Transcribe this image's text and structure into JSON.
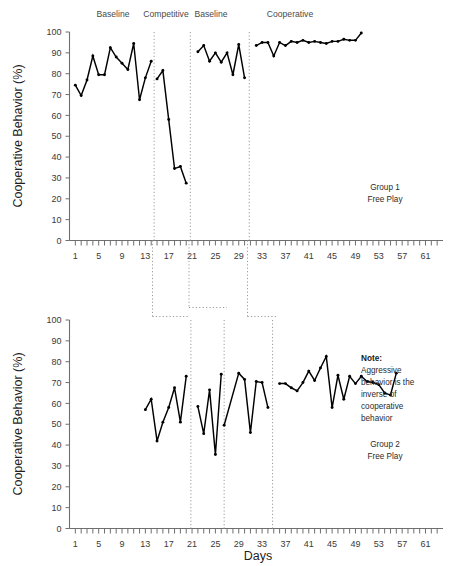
{
  "figure": {
    "xlabel": "Days",
    "ylabel_top": "Cooperative Behavior (%)",
    "ylabel_bottom": "Cooperative Behavior (%)"
  },
  "chart_data": [
    {
      "type": "line",
      "title": "Group 1 Free Play",
      "panel": "top",
      "xlabel": "",
      "ylabel": "Cooperative Behavior (%)",
      "xlim": [
        0,
        64
      ],
      "ylim": [
        0,
        100
      ],
      "grid": false,
      "legend": "none",
      "xticks": [
        1,
        5,
        9,
        13,
        17,
        21,
        25,
        29,
        33,
        37,
        41,
        45,
        49,
        53,
        57,
        61
      ],
      "yticks": [
        0,
        10,
        20,
        30,
        40,
        50,
        60,
        70,
        80,
        90,
        100
      ],
      "annotations": [
        "Group 1",
        "Free Play"
      ],
      "phases": [
        {
          "label": "Baseline",
          "x_start": 1,
          "x_end": 14
        },
        {
          "label": "Competitive",
          "x_start": 15,
          "x_end": 20
        },
        {
          "label": "Baseline",
          "x_start": 22,
          "x_end": 30
        },
        {
          "label": "Cooperative",
          "x_start": 32,
          "x_end": 50
        }
      ],
      "phase_dividers": [
        14.5,
        20.7,
        30.8
      ],
      "series": [
        {
          "name": "Baseline 1",
          "x": [
            1,
            2,
            3,
            4,
            5,
            6,
            7,
            8,
            9,
            10,
            11,
            12,
            13,
            14
          ],
          "values": [
            74.5,
            69.5,
            77.0,
            88.5,
            79.5,
            79.5,
            92.5,
            88.0,
            85.0,
            82.0,
            94.5,
            67.5,
            78.0,
            86.0
          ]
        },
        {
          "name": "Competitive",
          "x": [
            15,
            16,
            17,
            18,
            19,
            20
          ],
          "values": [
            77.5,
            81.5,
            58.0,
            34.5,
            35.5,
            27.5
          ]
        },
        {
          "name": "Baseline 2",
          "x": [
            22,
            23,
            24,
            25,
            26,
            27,
            28,
            29,
            30
          ],
          "values": [
            90.5,
            93.5,
            86.0,
            90.0,
            85.5,
            90.0,
            79.5,
            94.0,
            78.0
          ]
        },
        {
          "name": "Cooperative",
          "x": [
            32,
            33,
            34,
            35,
            36,
            37,
            38,
            39,
            40,
            41,
            42,
            43,
            44,
            45,
            46,
            47,
            48,
            49,
            50
          ],
          "values": [
            93.5,
            95.0,
            95.0,
            88.5,
            95.0,
            93.5,
            95.5,
            95.0,
            96.0,
            95.0,
            95.5,
            95.0,
            94.5,
            95.5,
            95.5,
            96.5,
            96.0,
            96.0,
            99.5
          ]
        }
      ]
    },
    {
      "type": "line",
      "title": "Group 2 Free Play",
      "panel": "bottom",
      "xlabel": "Days",
      "ylabel": "Cooperative Behavior (%)",
      "xlim": [
        0,
        64
      ],
      "ylim": [
        0,
        100
      ],
      "grid": false,
      "legend": "none",
      "xticks": [
        1,
        5,
        9,
        13,
        17,
        21,
        25,
        29,
        33,
        37,
        41,
        45,
        49,
        53,
        57,
        61
      ],
      "yticks": [
        0,
        10,
        20,
        30,
        40,
        50,
        60,
        70,
        80,
        90,
        100
      ],
      "annotations": [
        "Note:",
        "Aggressive",
        "behavior is the",
        "inverse of",
        "cooperative",
        "behavior",
        "Group 2",
        "Free Play"
      ],
      "phase_dividers": [
        20.8,
        26.5,
        34.8
      ],
      "series": [
        {
          "name": "Baseline 1",
          "x": [
            13,
            14,
            15,
            16,
            17,
            18,
            19,
            20
          ],
          "values": [
            57.0,
            62.0,
            42.0,
            51.0,
            58.0,
            67.5,
            51.0,
            73.0
          ]
        },
        {
          "name": "Competitive",
          "x": [
            22,
            23,
            24,
            25,
            26
          ],
          "values": [
            58.5,
            45.5,
            66.5,
            35.5,
            74.0
          ]
        },
        {
          "name": "Baseline 2",
          "x": [
            26.5,
            29,
            30,
            31,
            32,
            33,
            34
          ],
          "values": [
            49.5,
            74.5,
            71.5,
            46.0,
            70.5,
            70.0,
            58.0
          ]
        },
        {
          "name": "Cooperative",
          "x": [
            36,
            37,
            38,
            39,
            40,
            41,
            42,
            43,
            44,
            45,
            46,
            47,
            48,
            49,
            50,
            51,
            52,
            53,
            54,
            55,
            56
          ],
          "values": [
            69.5,
            69.5,
            67.5,
            66.0,
            70.0,
            75.5,
            71.0,
            77.0,
            82.5,
            58.0,
            73.5,
            62.0,
            73.0,
            69.5,
            73.0,
            70.5,
            70.0,
            69.0,
            65.0,
            64.0,
            74.5
          ]
        }
      ]
    }
  ],
  "connector": {
    "description": "dotted lines linking phase boundaries between the two panels"
  }
}
